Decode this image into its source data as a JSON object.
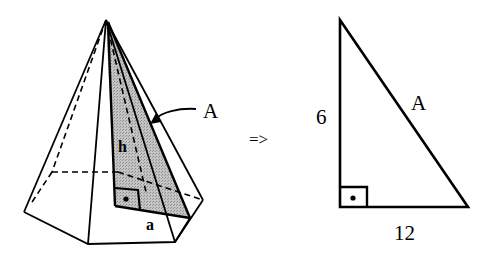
{
  "figure": {
    "pyramid": {
      "labels": {
        "height": "h",
        "apothem": "a",
        "slant": "A"
      }
    },
    "implies": "=>",
    "right_triangle": {
      "labels": {
        "vertical_leg": "6",
        "horizontal_leg": "12",
        "hypotenuse": "A"
      }
    },
    "colors": {
      "line": "#000000",
      "shade": "#b8b8b8",
      "background": "#ffffff"
    }
  }
}
